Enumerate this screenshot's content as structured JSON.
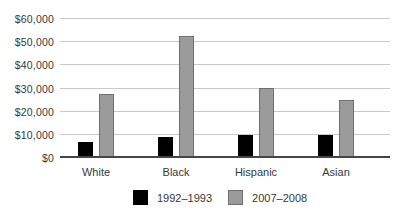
{
  "chart_data": {
    "type": "bar",
    "title": "",
    "xlabel": "",
    "ylabel": "",
    "categories": [
      "White",
      "Black",
      "Hispanic",
      "Asian"
    ],
    "series": [
      {
        "name": "1992–1993",
        "color": "#000000",
        "border_color": "#000000",
        "values": [
          7000,
          9000,
          10000,
          10000
        ]
      },
      {
        "name": "2007–2008",
        "color": "#9b9b9b",
        "border_color": "#6f6f6f",
        "values": [
          27500,
          52500,
          30000,
          25000
        ]
      }
    ],
    "ylim": [
      0,
      60000
    ],
    "ytick_step": 10000,
    "yticks": [
      0,
      10000,
      20000,
      30000,
      40000,
      50000,
      60000
    ],
    "ytick_labels": [
      "$0",
      "$10,000",
      "$20,000",
      "$30,000",
      "$40,000",
      "$50,000",
      "$60,000"
    ],
    "grid": "horizontal",
    "legend_position": "bottom",
    "gridline_color": "#c9c9c9",
    "axis_color": "#454545",
    "text_color": "#383838",
    "background_color": "#ffffff"
  }
}
